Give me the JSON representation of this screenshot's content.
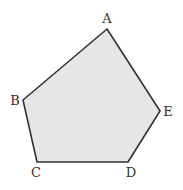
{
  "diagram": {
    "type": "pentagon",
    "fill": "#e6e6e6",
    "stroke": "#333333",
    "vertices": [
      {
        "label": "A",
        "x": 107,
        "y": 29,
        "lx": 107,
        "ly": 23
      },
      {
        "label": "B",
        "x": 23,
        "y": 100,
        "lx": 15,
        "ly": 105
      },
      {
        "label": "C",
        "x": 37,
        "y": 162,
        "lx": 36,
        "ly": 177
      },
      {
        "label": "D",
        "x": 128,
        "y": 162,
        "lx": 131,
        "ly": 177
      },
      {
        "label": "E",
        "x": 160,
        "y": 111,
        "lx": 168,
        "ly": 116
      }
    ]
  }
}
